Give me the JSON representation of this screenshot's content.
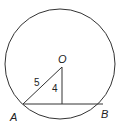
{
  "diagram": {
    "type": "geometry",
    "circle": {
      "cx": 60,
      "cy": 64,
      "r": 55,
      "center_label": "O"
    },
    "points": {
      "O": {
        "label": "O",
        "x": 62,
        "y": 67
      },
      "A": {
        "label": "A",
        "x": 23,
        "y": 104
      },
      "B": {
        "label": "B",
        "x": 103,
        "y": 104
      },
      "F": {
        "label": "",
        "x": 62,
        "y": 104
      }
    },
    "segments": [
      {
        "from": "O",
        "to": "A",
        "length_label": "5"
      },
      {
        "from": "O",
        "to": "F",
        "length_label": "4"
      },
      {
        "from": "A",
        "to": "B",
        "length_label": ""
      }
    ],
    "labels": {
      "O": "O",
      "A": "A",
      "B": "B",
      "OA": "5",
      "OF": "4"
    },
    "stroke_color": "#333333"
  }
}
